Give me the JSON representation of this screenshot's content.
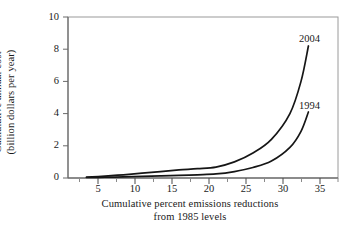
{
  "chart_data": {
    "type": "line",
    "title": "",
    "xlabel": "Cumulative percent emissions reductions from 1985 levels",
    "xlabel_line1": "Cumulative percent emissions reductions",
    "xlabel_line2": "from 1985 levels",
    "ylabel": "Cumulative annual cost (billion dollars per year)",
    "ylabel_line1": "Cumulative annual cost",
    "ylabel_line2": "(billion dollars per year)",
    "xlim": [
      0,
      36.5
    ],
    "ylim": [
      0,
      10
    ],
    "xticks": [
      5,
      10,
      15,
      20,
      25,
      30,
      35
    ],
    "yticks": [
      0,
      2,
      4,
      6,
      8,
      10
    ],
    "xtick_labels": [
      "5",
      "10",
      "15",
      "20",
      "25",
      "30",
      "35"
    ],
    "ytick_labels": [
      "0",
      "2",
      "4",
      "6",
      "8",
      "10"
    ],
    "xminor_step": 2.5,
    "grid": false,
    "legend_position": "inline-annotation",
    "line_color": "#161616",
    "series": [
      {
        "name": "2004",
        "label": "2004",
        "x": [
          2.5,
          5.0,
          7.5,
          10.0,
          12.5,
          15.0,
          17.5,
          20.0,
          22.5,
          25.0,
          27.5,
          30.0,
          31.5,
          32.5
        ],
        "values": [
          0.05,
          0.12,
          0.2,
          0.3,
          0.4,
          0.5,
          0.58,
          0.68,
          1.0,
          1.55,
          2.4,
          4.0,
          6.0,
          8.2
        ]
      },
      {
        "name": "1994",
        "label": "1994",
        "x": [
          2.5,
          5.0,
          7.5,
          10.0,
          12.5,
          15.0,
          17.5,
          20.0,
          22.5,
          25.0,
          27.5,
          30.0,
          31.5,
          32.5
        ],
        "values": [
          0.03,
          0.05,
          0.07,
          0.1,
          0.13,
          0.16,
          0.2,
          0.25,
          0.4,
          0.65,
          1.05,
          1.9,
          2.9,
          4.1
        ]
      }
    ],
    "annotations": [
      {
        "text": "2004",
        "x": 33.0,
        "y": 9.05
      },
      {
        "text": "1994",
        "x": 33.0,
        "y": 4.85
      }
    ]
  }
}
